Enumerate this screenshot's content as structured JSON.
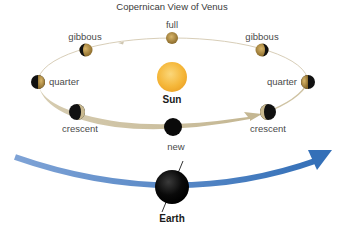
{
  "diagram": {
    "title": "Copernican View of Venus",
    "central_body": {
      "label": "Sun",
      "color": "#f5b73a"
    },
    "observer": {
      "label": "Earth",
      "color": "#111111"
    },
    "orbit_colors": {
      "venus_orbit": "#d9ceb3",
      "earth_orbit": "#4a7fc0"
    },
    "venus_phases": [
      {
        "id": "full",
        "label": "full"
      },
      {
        "id": "gibbous-left",
        "label": "gibbous"
      },
      {
        "id": "gibbous-right",
        "label": "gibbous"
      },
      {
        "id": "quarter-left",
        "label": "quarter"
      },
      {
        "id": "quarter-right",
        "label": "quarter"
      },
      {
        "id": "crescent-left",
        "label": "crescent"
      },
      {
        "id": "crescent-right",
        "label": "crescent"
      },
      {
        "id": "new",
        "label": "new"
      }
    ]
  }
}
